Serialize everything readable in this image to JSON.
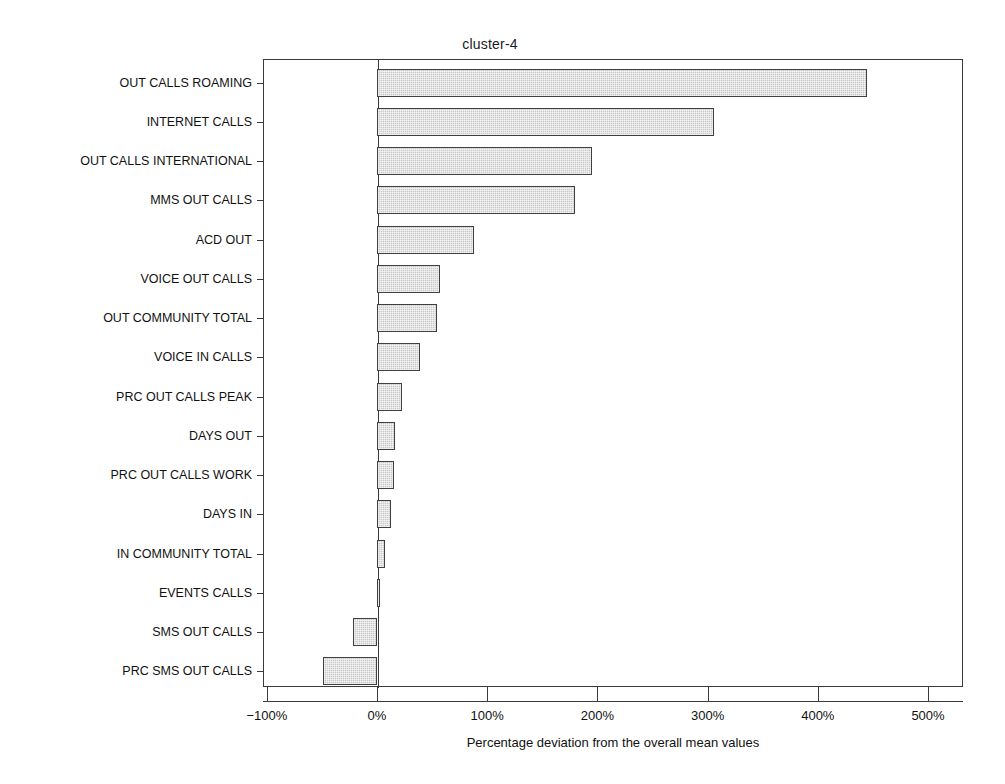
{
  "chart_data": {
    "type": "bar",
    "orientation": "horizontal",
    "title": "cluster-4",
    "xlabel": "Percentage deviation from the overall mean values",
    "ylabel": "",
    "xlim": [
      -100,
      540
    ],
    "xticks": [
      -100,
      0,
      100,
      200,
      300,
      400,
      500
    ],
    "xtick_labels": [
      "−100%",
      "0%",
      "100%",
      "200%",
      "300%",
      "400%",
      "500%"
    ],
    "grid": false,
    "legend": null,
    "bar_color": "#c9c9c9",
    "bar_edge_color": "#404040",
    "categories": [
      "OUT CALLS ROAMING",
      "INTERNET CALLS",
      "OUT CALLS INTERNATIONAL",
      "MMS OUT CALLS",
      "ACD OUT",
      "VOICE OUT CALLS",
      "OUT COMMUNITY TOTAL",
      "VOICE IN CALLS",
      "PRC OUT CALLS PEAK",
      "DAYS OUT",
      "PRC OUT CALLS WORK",
      "DAYS IN",
      "IN COMMUNITY TOTAL",
      "EVENTS CALLS",
      "SMS OUT CALLS",
      "PRC SMS OUT CALLS"
    ],
    "values": [
      445,
      306,
      195,
      180,
      88,
      57,
      54,
      39,
      23,
      16,
      15,
      13,
      7,
      3,
      -22,
      -49
    ],
    "units": "percent"
  }
}
